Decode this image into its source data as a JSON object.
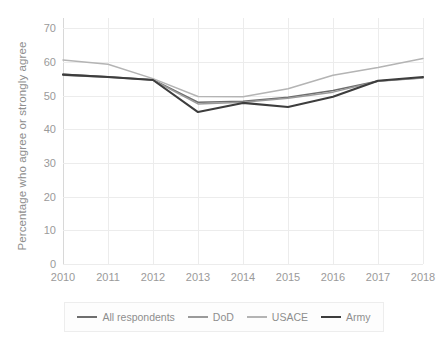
{
  "chart_data": {
    "type": "line",
    "title": "",
    "xlabel": "",
    "ylabel": "Percentage who agree or strongly agree",
    "x": [
      2010,
      2011,
      2012,
      2013,
      2014,
      2015,
      2016,
      2017,
      2018
    ],
    "xtick_labels": [
      "2010",
      "2011",
      "2012",
      "2013",
      "2014",
      "2015",
      "2016",
      "2017",
      "2018"
    ],
    "ytick_labels": [
      "0",
      "10",
      "20",
      "30",
      "40",
      "50",
      "60",
      "70"
    ],
    "yticks": [
      0,
      10,
      20,
      30,
      40,
      50,
      60,
      70
    ],
    "ylim": [
      0,
      73
    ],
    "xlim": [
      2010,
      2018
    ],
    "grid": true,
    "legend_position": "bottom",
    "series": [
      {
        "name": "All respondents",
        "color": "#6e6e6e",
        "values": [
          56.3,
          55.6,
          54.7,
          48.0,
          48.3,
          49.5,
          51.5,
          54.3,
          55.3
        ]
      },
      {
        "name": "DoD",
        "color": "#9a9a9a",
        "values": [
          56.0,
          55.4,
          54.6,
          47.5,
          48.0,
          49.2,
          51.0,
          54.2,
          55.2
        ]
      },
      {
        "name": "USACE",
        "color": "#b4b4b4",
        "values": [
          60.5,
          59.3,
          55.0,
          49.7,
          49.6,
          52.0,
          56.0,
          58.3,
          61.0
        ]
      },
      {
        "name": "Army",
        "color": "#3d3d3d",
        "values": [
          56.2,
          55.5,
          54.6,
          45.1,
          47.8,
          46.6,
          49.6,
          54.4,
          55.5
        ]
      }
    ]
  },
  "legend": {
    "items": [
      {
        "label": "All respondents"
      },
      {
        "label": "DoD"
      },
      {
        "label": "USACE"
      },
      {
        "label": "Army"
      }
    ]
  }
}
